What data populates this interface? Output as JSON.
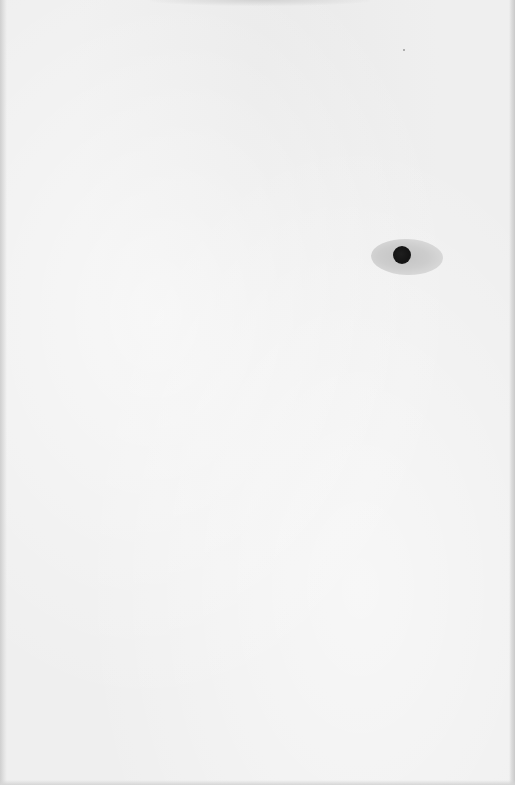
{
  "document": {
    "type": "scanned blank page",
    "text": "",
    "background_color": "#efefef",
    "marks": [
      {
        "kind": "ink-blot",
        "x": 402,
        "y": 255,
        "dot_color": "#141414",
        "halo_color": "#cdcdcd"
      },
      {
        "kind": "speck",
        "x": 404,
        "y": 50,
        "color": "#9a9a9a"
      }
    ]
  }
}
